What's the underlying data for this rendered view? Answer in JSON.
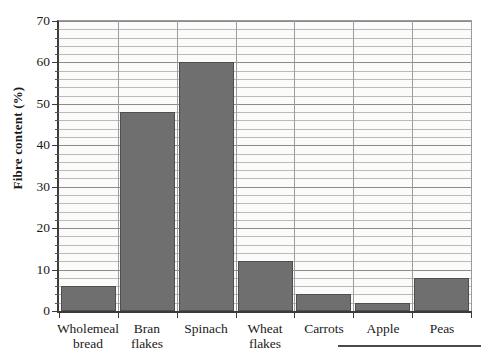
{
  "page": {
    "top_cut_text": "",
    "bottom_rule": "page-rule"
  },
  "chart_data": {
    "type": "bar",
    "title": "",
    "xlabel": "",
    "ylabel": "Fibre content (%)",
    "categories": [
      "Wholemeal\nbread",
      "Bran\nflakes",
      "Spinach",
      "Wheat\nflakes",
      "Carrots",
      "Apple",
      "Peas"
    ],
    "values": [
      6,
      48,
      60,
      12,
      4,
      2,
      8
    ],
    "ylim": [
      0,
      70
    ],
    "ytick_labels": [
      "0",
      "10",
      "20",
      "30",
      "40",
      "50",
      "60",
      "70"
    ],
    "ytick_values": [
      0,
      10,
      20,
      30,
      40,
      50,
      60,
      70
    ],
    "yminor_step": 2,
    "grid": true,
    "legend": "none",
    "bar_color": "#6f6f6f",
    "axis_color": "#3a3a3a",
    "grid_color": "#b9b9b9",
    "plot_background": "#fbfbfa"
  }
}
